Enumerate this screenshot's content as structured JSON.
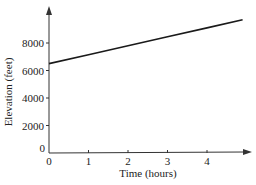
{
  "chart_data": {
    "type": "line",
    "title": "",
    "xlabel": "Time (hours)",
    "ylabel": "Elevation (feet)",
    "x_ticks": [
      "0",
      "1",
      "2",
      "3",
      "4"
    ],
    "y_ticks": [
      "0",
      "2000",
      "4000",
      "6000",
      "8000"
    ],
    "xlim": [
      0,
      5
    ],
    "ylim": [
      0,
      10000
    ],
    "grid": false,
    "legend": null,
    "series": [
      {
        "name": "Elevation",
        "x": [
          0,
          1,
          2,
          3,
          4,
          4.9
        ],
        "y": [
          6500,
          7150,
          7800,
          8450,
          9100,
          9685
        ]
      }
    ],
    "color": "#1a1a1a"
  }
}
